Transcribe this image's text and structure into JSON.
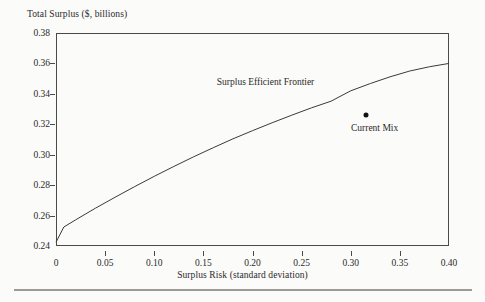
{
  "chart_data": {
    "type": "line",
    "title": "",
    "xlabel": "Surplus Risk (standard deviation)",
    "ylabel": "Total Surplus ($, billions)",
    "xlim": [
      0,
      0.4
    ],
    "ylim": [
      0.24,
      0.38
    ],
    "grid": false,
    "legend": "none",
    "x_ticks": [
      0,
      0.05,
      0.1,
      0.15,
      0.2,
      0.25,
      0.3,
      0.35,
      0.4
    ],
    "x_tick_labels": [
      "0",
      "0.05",
      "0.10",
      "0.15",
      "0.20",
      "0.25",
      "0.30",
      "0.35",
      "0.40"
    ],
    "y_ticks": [
      0.24,
      0.26,
      0.28,
      0.3,
      0.32,
      0.34,
      0.36,
      0.38
    ],
    "y_tick_labels": [
      "0.24",
      "0.26",
      "0.28",
      "0.30",
      "0.32",
      "0.34",
      "0.36",
      "0.38"
    ],
    "series": [
      {
        "name": "Surplus Efficient Frontier",
        "type": "line",
        "x": [
          0.0,
          0.008,
          0.02,
          0.04,
          0.06,
          0.08,
          0.1,
          0.12,
          0.14,
          0.16,
          0.18,
          0.2,
          0.22,
          0.24,
          0.26,
          0.28,
          0.3,
          0.32,
          0.34,
          0.36,
          0.38,
          0.4
        ],
        "y": [
          0.2425,
          0.2525,
          0.2572,
          0.2648,
          0.272,
          0.279,
          0.2858,
          0.2923,
          0.2986,
          0.3046,
          0.3104,
          0.3158,
          0.321,
          0.326,
          0.3308,
          0.3352,
          0.342,
          0.3468,
          0.3512,
          0.355,
          0.3578,
          0.36
        ]
      },
      {
        "name": "Current Mix",
        "type": "scatter",
        "x": [
          0.316
        ],
        "y": [
          0.3262
        ]
      }
    ],
    "annotations": [
      {
        "text": "Surplus Efficient Frontier",
        "x": 0.2133,
        "y": 0.3475
      },
      {
        "text": "Current Mix",
        "x": 0.3243,
        "y": 0.3178
      }
    ]
  },
  "colors": {
    "line": "#3a3a3a",
    "marker": "#111111",
    "axis": "#4a4a4a",
    "text": "#2a2a2a",
    "background": "#fbfbf9",
    "footer_rule": "#9a9a9a"
  }
}
